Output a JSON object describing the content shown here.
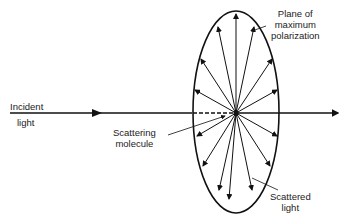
{
  "diagram": {
    "labels": {
      "plane": [
        "Plane of",
        "maximum",
        "polarization"
      ],
      "incident": [
        "Incident",
        "light"
      ],
      "molecule": [
        "Scattering",
        "molecule"
      ],
      "scattered": [
        "Scattered",
        "light"
      ]
    },
    "ellipse": {
      "cx": 236,
      "cy": 113,
      "rx": 43,
      "ry": 101
    },
    "colors": {
      "stroke": "#111111",
      "text": "#222222"
    }
  }
}
